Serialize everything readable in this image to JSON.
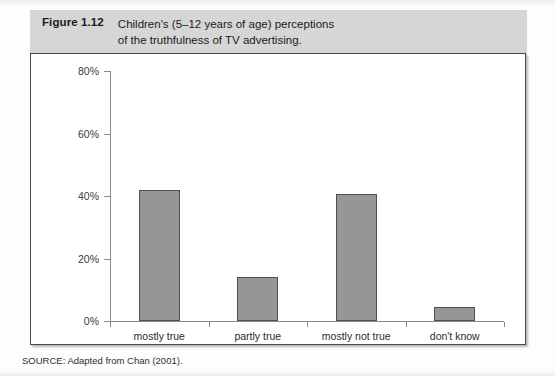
{
  "figure": {
    "number": "Figure 1.12",
    "caption_line_1": "Children's (5–12 years of age) perceptions",
    "caption_line_2": "of the truthfulness of TV advertising."
  },
  "source": {
    "note": "SOURCE: Adapted from Chan (2001)."
  },
  "colors": {
    "bar_fill": "#969696",
    "bar_border": "#4f4f4f",
    "caption_band": "#d6d6d6",
    "axis": "#8a8a8a",
    "frame": "#4a4a4a"
  },
  "chart_data": {
    "type": "bar",
    "xlabel": "",
    "ylabel": "",
    "categories": [
      "mostly true",
      "partly true",
      "mostly not true",
      "don't know"
    ],
    "values": [
      42,
      14,
      40.5,
      4.5
    ],
    "tick_labels": [
      "0%",
      "20%",
      "40%",
      "60%",
      "80%"
    ],
    "tick_values": [
      0,
      20,
      40,
      60,
      80
    ],
    "ylim": [
      0,
      80
    ],
    "grid": false,
    "legend": "none",
    "value_format": "percent"
  }
}
